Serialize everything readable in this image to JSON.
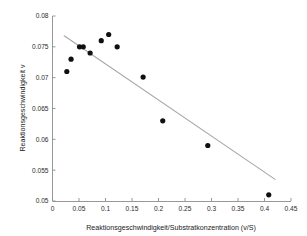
{
  "chart_data": {
    "type": "scatter",
    "title": "",
    "xlabel": "Reaktionsgeschwindigkeit/Substratkonzentration (v/S)",
    "ylabel": "Reaktionsgeschwindigkeit v",
    "xlim": [
      0,
      0.45
    ],
    "ylim": [
      0.05,
      0.08
    ],
    "grid": false,
    "legend": null,
    "xticks": [
      0,
      0.05,
      0.1,
      0.15,
      0.2,
      0.25,
      0.3,
      0.35,
      0.4,
      0.45
    ],
    "xticklabels": [
      "0",
      "0.05",
      "0.1",
      "0.15",
      "0.2",
      "0.25",
      "0.3",
      "0.35",
      "0.4",
      "0.45"
    ],
    "yticks": [
      0.05,
      0.055,
      0.06,
      0.065,
      0.07,
      0.075,
      0.08
    ],
    "yticklabels": [
      "0.05",
      "0.055",
      "0.06",
      "0.065",
      "0.07",
      "0.075",
      "0.08"
    ],
    "series": [
      {
        "name": "Messpunkte",
        "marker": "circle",
        "color": "#101010",
        "x": [
          0.027,
          0.035,
          0.051,
          0.058,
          0.071,
          0.092,
          0.106,
          0.122,
          0.171,
          0.208,
          0.293,
          0.408
        ],
        "y": [
          0.071,
          0.073,
          0.075,
          0.075,
          0.074,
          0.076,
          0.077,
          0.075,
          0.0701,
          0.063,
          0.059,
          0.051
        ]
      }
    ],
    "fit_line": {
      "name": "Regressionsgerade",
      "color": "#a8a8a8",
      "x": [
        0.022,
        0.42
      ],
      "y": [
        0.0768,
        0.0535
      ]
    }
  }
}
